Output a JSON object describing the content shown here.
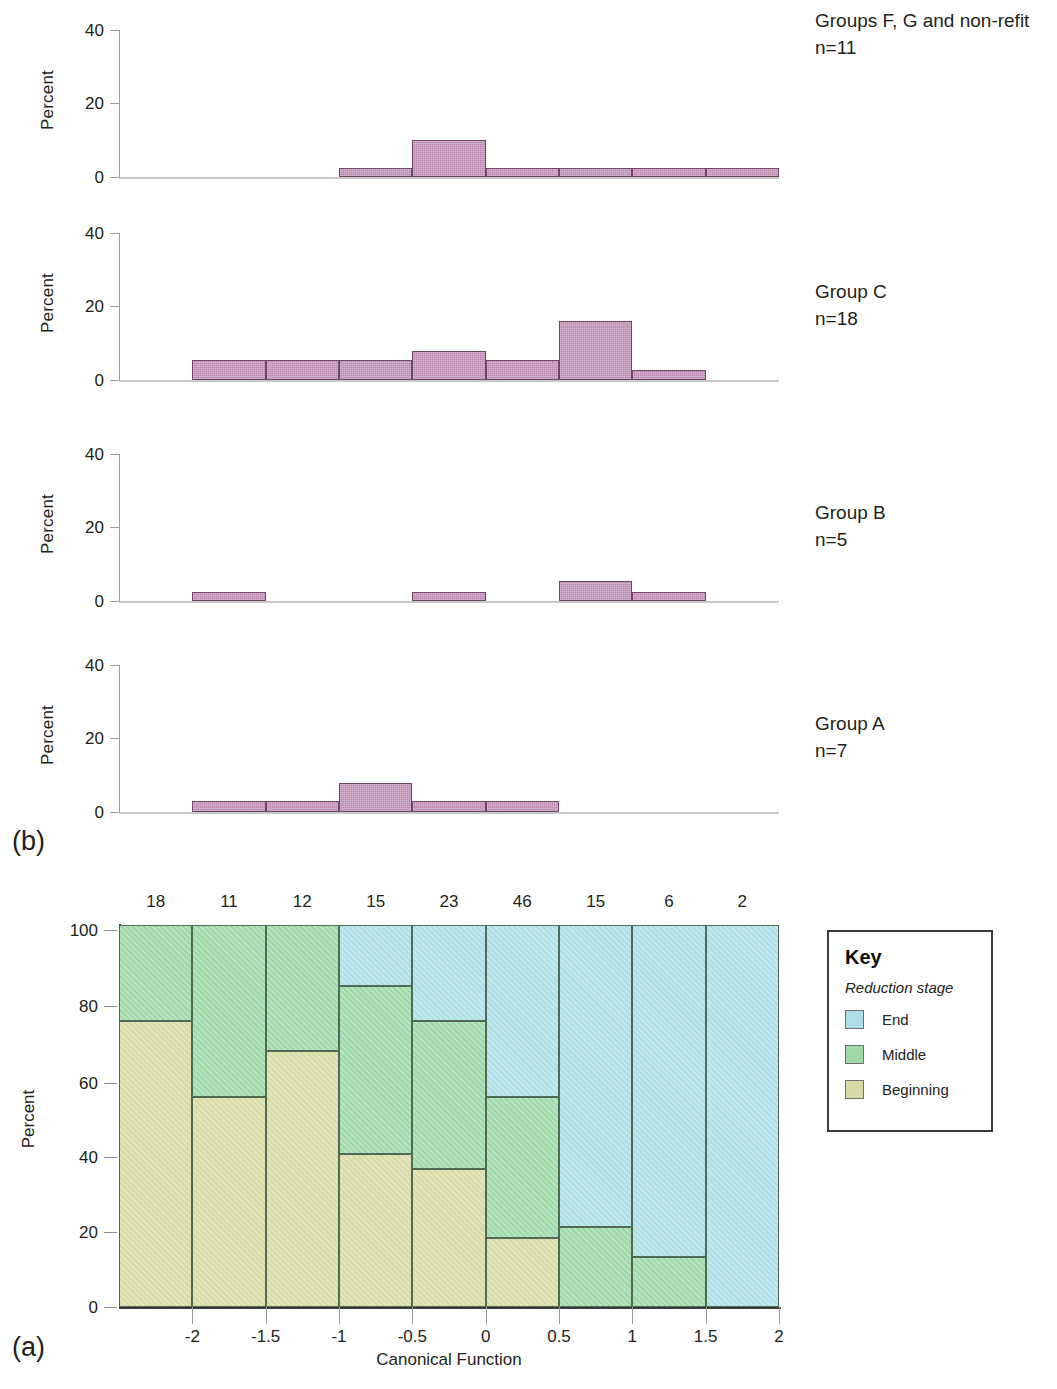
{
  "figure": {
    "panel_a_letter": "(a)",
    "panel_b_letter": "(b)"
  },
  "chart_data": [
    {
      "id": "panel_a",
      "type": "bar",
      "subtype": "stacked-percentage-histogram",
      "title": "",
      "xlabel": "Canonical Function",
      "ylabel": "Percent",
      "ylim": [
        0,
        100
      ],
      "yticks": [
        0,
        20,
        40,
        60,
        80,
        100
      ],
      "xticks": [
        -2,
        -1.5,
        -1,
        -0.5,
        0,
        0.5,
        1,
        1.5,
        2
      ],
      "xticklabels": [
        "-2",
        "-1.5",
        "-1",
        "-0.5",
        "0",
        "0.5",
        "1",
        "1.5",
        "2"
      ],
      "grid": false,
      "legend_position": "right",
      "bin_counts": [
        18,
        11,
        12,
        15,
        23,
        46,
        15,
        6,
        2
      ],
      "bin_count_label_header": "",
      "categories": [
        "bin1",
        "bin2",
        "bin3",
        "bin4",
        "bin5",
        "bin6",
        "bin7",
        "bin8",
        "bin9"
      ],
      "series": [
        {
          "name": "Beginning",
          "color": "#d9dba6",
          "values": [
            75,
            55,
            67,
            40,
            36,
            18,
            0,
            0,
            0
          ]
        },
        {
          "name": "Middle",
          "color": "#9fd9a9",
          "values": [
            25,
            45,
            33,
            44,
            39,
            37,
            21,
            13,
            0
          ]
        },
        {
          "name": "End",
          "color": "#ade0e6",
          "values": [
            0,
            0,
            0,
            16,
            25,
            45,
            79,
            87,
            100
          ]
        }
      ]
    },
    {
      "id": "panel_b_1",
      "type": "bar",
      "subtype": "histogram",
      "caption": "Groups F, G and non-refit\nn=11",
      "group_label": "Groups F, G and non-refit",
      "n_label": "n=11",
      "ylabel": "Percent",
      "ylim": [
        0,
        45
      ],
      "yticks": [
        0,
        20,
        40
      ],
      "categories": [
        "bin1",
        "bin2",
        "bin3",
        "bin4",
        "bin5",
        "bin6",
        "bin7",
        "bin8",
        "bin9"
      ],
      "values": [
        0,
        0,
        0,
        2.5,
        10.2,
        2.5,
        2.5,
        2.5,
        2.5
      ]
    },
    {
      "id": "panel_b_2",
      "type": "bar",
      "subtype": "histogram",
      "caption": "Group C\nn=18",
      "group_label": "Group C",
      "n_label": "n=18",
      "ylabel": "Percent",
      "ylim": [
        0,
        45
      ],
      "yticks": [
        0,
        20,
        40
      ],
      "categories": [
        "bin1",
        "bin2",
        "bin3",
        "bin4",
        "bin5",
        "bin6",
        "bin7",
        "bin8",
        "bin9"
      ],
      "values": [
        0,
        5.5,
        5.5,
        5.5,
        8.0,
        5.5,
        16.0,
        2.8,
        0
      ]
    },
    {
      "id": "panel_b_3",
      "type": "bar",
      "subtype": "histogram",
      "caption": "Group B\nn=5",
      "group_label": "Group B",
      "n_label": "n=5",
      "ylabel": "Percent",
      "ylim": [
        0,
        45
      ],
      "yticks": [
        0,
        20,
        40
      ],
      "categories": [
        "bin1",
        "bin2",
        "bin3",
        "bin4",
        "bin5",
        "bin6",
        "bin7",
        "bin8",
        "bin9"
      ],
      "values": [
        0,
        2.5,
        0,
        0,
        2.5,
        0,
        5.5,
        2.5,
        0
      ]
    },
    {
      "id": "panel_b_4",
      "type": "bar",
      "subtype": "histogram",
      "caption": "Group A\nn=7",
      "group_label": "Group A",
      "n_label": "n=7",
      "ylabel": "Percent",
      "ylim": [
        0,
        45
      ],
      "yticks": [
        0,
        20,
        40
      ],
      "categories": [
        "bin1",
        "bin2",
        "bin3",
        "bin4",
        "bin5",
        "bin6",
        "bin7",
        "bin8",
        "bin9"
      ],
      "values": [
        0,
        3.0,
        3.0,
        8.0,
        3.0,
        3.0,
        0,
        0,
        0
      ]
    }
  ],
  "legend": {
    "title": "Key",
    "subtitle": "Reduction stage",
    "items": [
      {
        "label": "End",
        "color": "#ade0e6"
      },
      {
        "label": "Middle",
        "color": "#9fd9a9"
      },
      {
        "label": "Beginning",
        "color": "#d9dba6"
      }
    ]
  }
}
